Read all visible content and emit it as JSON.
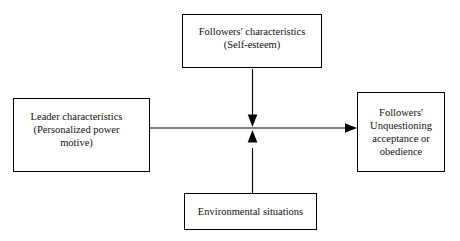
{
  "diagram": {
    "type": "flow-diagram",
    "background_color": "#ffffff",
    "line_color": "#000000",
    "nodes": [
      {
        "id": "followers-characteristics",
        "label": "Followers' characteristics\n(Self-esteem)",
        "position": "top"
      },
      {
        "id": "leader-characteristics",
        "label": "Leader characteristics\n(Personalized power\nmotive)",
        "position": "left"
      },
      {
        "id": "follower-obedience",
        "label": "Followers'\nUnquestioning\nacceptance or\nobedience",
        "position": "right"
      },
      {
        "id": "environmental-situations",
        "label": "Environmental situations",
        "position": "bottom"
      }
    ],
    "connectors": [
      {
        "id": "leader-to-obedience",
        "from": "leader-characteristics",
        "to": "follower-obedience",
        "direction": "right",
        "arrowhead": "end"
      },
      {
        "id": "followers-characteristics-to-path",
        "from": "followers-characteristics",
        "to": "leader-to-obedience",
        "direction": "down",
        "arrowhead": "end"
      },
      {
        "id": "environmental-situations-to-path",
        "from": "environmental-situations",
        "to": "leader-to-obedience",
        "direction": "up",
        "arrowhead": "end"
      }
    ]
  }
}
